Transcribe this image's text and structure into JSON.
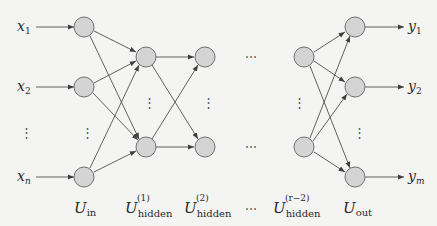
{
  "diagram": {
    "inputs": [
      {
        "main": "x",
        "sub": "1"
      },
      {
        "main": "x",
        "sub": "2"
      },
      {
        "main": "x",
        "sub": "n"
      }
    ],
    "outputs": [
      {
        "main": "y",
        "sub": "1"
      },
      {
        "main": "y",
        "sub": "2"
      },
      {
        "main": "y",
        "sub": "m"
      }
    ],
    "layers": [
      {
        "main": "U",
        "sub": "in",
        "sup": ""
      },
      {
        "main": "U",
        "sub": "hidden",
        "sup": "(1)"
      },
      {
        "main": "U",
        "sub": "hidden",
        "sup": "(2)"
      },
      {
        "main": "",
        "sub": "",
        "sup": "",
        "dots": "…"
      },
      {
        "main": "U",
        "sub": "hidden",
        "sup": "(r−2)"
      },
      {
        "main": "U",
        "sub": "out",
        "sup": ""
      }
    ],
    "vdots": "⋮",
    "hdots": "⋯",
    "colors": {
      "node_fill": "#d4d4d4",
      "node_stroke": "#707070",
      "edge": "#505050",
      "background": "#f4f4f2"
    }
  }
}
